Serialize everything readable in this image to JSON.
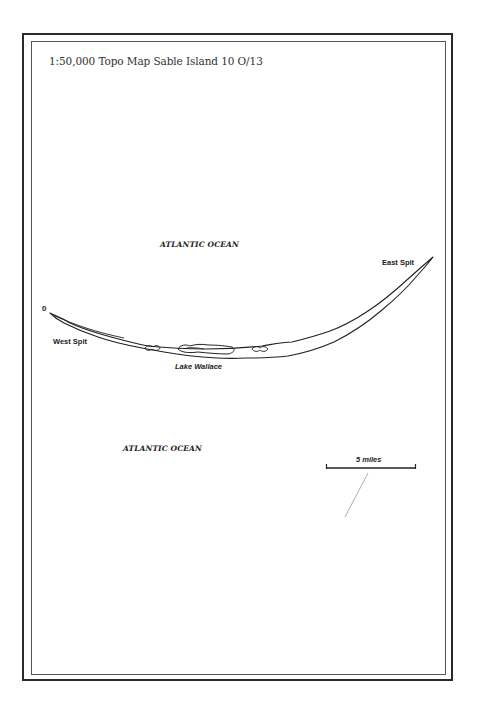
{
  "map": {
    "title": "1:50,000 Topo Map Sable Island 10 O/13",
    "labels": {
      "ocean_north": "ATLANTIC OCEAN",
      "ocean_south": "ATLANTIC OCEAN",
      "east_spit": "East Spit",
      "west_spit": "West Spit",
      "lake": "Lake Wallace",
      "west_marker": "0"
    },
    "scale_bar": {
      "label": "5 miles"
    },
    "colors": {
      "line": "#222222",
      "frame": "#2a2a2a",
      "background": "#ffffff"
    }
  }
}
